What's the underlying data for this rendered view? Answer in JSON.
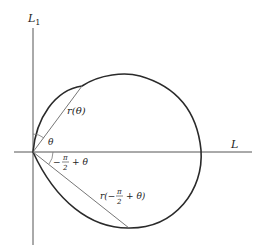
{
  "diagram": {
    "axes": {
      "vertical_label": "L",
      "vertical_label_sub": "1",
      "horizontal_label": "L"
    },
    "labels": {
      "r_theta": "r(θ)",
      "theta": "θ",
      "angle_minus": "−",
      "angle_pi": "π",
      "angle_two": "2",
      "angle_plus_theta": "+ θ",
      "r2_prefix": "r(−",
      "r2_pi": "π",
      "r2_two": "2",
      "r2_suffix": "+ θ)"
    },
    "colors": {
      "curve": "#2a2a2a",
      "axes": "#555555",
      "rays": "#666666"
    }
  }
}
